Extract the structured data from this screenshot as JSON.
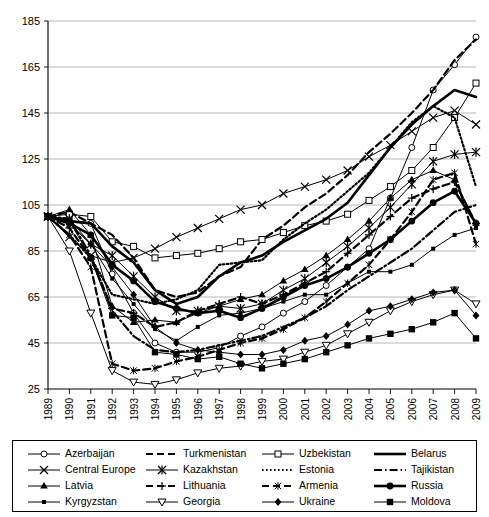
{
  "chart_data": {
    "type": "line",
    "title": "",
    "xlabel": "",
    "ylabel": "",
    "xlim": [
      1989,
      2009
    ],
    "ylim": [
      25,
      185
    ],
    "yticks": [
      25,
      45,
      65,
      85,
      105,
      125,
      145,
      165,
      185
    ],
    "grid": true,
    "legend_position": "bottom",
    "x": [
      1989,
      1990,
      1991,
      1992,
      1993,
      1994,
      1995,
      1996,
      1997,
      1998,
      1999,
      2000,
      2001,
      2002,
      2003,
      2004,
      2005,
      2006,
      2007,
      2008,
      2009
    ],
    "series": [
      {
        "name": "Azerbaijan",
        "marker": "circle-open",
        "style": "solid",
        "values": [
          100,
          98,
          97,
          75,
          58,
          45,
          41,
          41,
          43,
          48,
          52,
          58,
          63,
          70,
          78,
          86,
          108,
          130,
          155,
          166,
          178
        ]
      },
      {
        "name": "Turkmenistan",
        "marker": "none",
        "style": "dashed",
        "values": [
          100,
          102,
          97,
          92,
          82,
          68,
          65,
          67,
          74,
          78,
          90,
          96,
          104,
          110,
          118,
          128,
          136,
          145,
          155,
          168,
          177
        ]
      },
      {
        "name": "Uzbekistan",
        "marker": "square-open",
        "style": "solid",
        "values": [
          100,
          101,
          100,
          89,
          87,
          82,
          83,
          84,
          86,
          89,
          90,
          93,
          96,
          98,
          101,
          107,
          113,
          120,
          130,
          143,
          158
        ]
      },
      {
        "name": "Belarus",
        "marker": "none",
        "style": "solid-thick",
        "values": [
          100,
          98,
          97,
          87,
          80,
          68,
          62,
          65,
          74,
          80,
          83,
          89,
          94,
          99,
          106,
          118,
          130,
          140,
          148,
          155,
          152
        ]
      },
      {
        "name": "Central Europe",
        "marker": "x",
        "style": "solid",
        "values": [
          100,
          91,
          83,
          80,
          82,
          86,
          91,
          95,
          99,
          103,
          105,
          110,
          113,
          116,
          120,
          126,
          131,
          137,
          143,
          146,
          140
        ]
      },
      {
        "name": "Kazakhstan",
        "marker": "asterisk",
        "style": "solid",
        "values": [
          100,
          99,
          88,
          83,
          74,
          65,
          59,
          59,
          61,
          60,
          62,
          68,
          73,
          80,
          87,
          95,
          104,
          114,
          124,
          127,
          128
        ]
      },
      {
        "name": "Estonia",
        "marker": "none",
        "style": "dotted",
        "values": [
          100,
          92,
          82,
          66,
          64,
          62,
          64,
          68,
          79,
          80,
          81,
          90,
          97,
          103,
          111,
          119,
          130,
          141,
          148,
          143,
          113
        ]
      },
      {
        "name": "Tajikistan",
        "marker": "none",
        "style": "dash-dot",
        "values": [
          100,
          99,
          83,
          59,
          48,
          42,
          41,
          42,
          44,
          46,
          48,
          52,
          56,
          61,
          68,
          74,
          80,
          86,
          94,
          102,
          105
        ]
      },
      {
        "name": "Latvia",
        "marker": "triangle-up",
        "style": "solid",
        "values": [
          100,
          103,
          92,
          61,
          54,
          55,
          54,
          58,
          61,
          64,
          66,
          72,
          77,
          83,
          90,
          98,
          108,
          116,
          120,
          116,
          97
        ]
      },
      {
        "name": "Lithuania",
        "marker": "plus",
        "style": "dashed",
        "values": [
          100,
          95,
          82,
          60,
          58,
          52,
          54,
          59,
          62,
          65,
          62,
          66,
          71,
          76,
          84,
          92,
          100,
          108,
          112,
          115,
          97
        ]
      },
      {
        "name": "Armenia",
        "marker": "asterisk-small",
        "style": "dashed",
        "values": [
          100,
          92,
          78,
          36,
          33,
          34,
          37,
          39,
          42,
          45,
          47,
          51,
          56,
          63,
          71,
          79,
          90,
          102,
          116,
          119,
          88
        ]
      },
      {
        "name": "Russia",
        "marker": "hexagon-filled",
        "style": "solid-thick",
        "values": [
          100,
          97,
          92,
          79,
          72,
          63,
          60,
          58,
          59,
          56,
          60,
          65,
          70,
          73,
          78,
          84,
          90,
          98,
          106,
          111,
          97
        ]
      },
      {
        "name": "Kyrgyzstan",
        "marker": "square-small",
        "style": "solid",
        "values": [
          100,
          97,
          88,
          73,
          62,
          51,
          46,
          52,
          57,
          58,
          60,
          63,
          66,
          66,
          71,
          76,
          76,
          79,
          86,
          92,
          95
        ]
      },
      {
        "name": "Georgia",
        "marker": "triangle-down",
        "style": "solid",
        "values": [
          100,
          85,
          58,
          33,
          28,
          27,
          29,
          32,
          34,
          35,
          37,
          38,
          41,
          44,
          49,
          54,
          59,
          63,
          66,
          68,
          62
        ]
      },
      {
        "name": "Ukraine",
        "marker": "diamond-filled",
        "style": "solid",
        "values": [
          100,
          97,
          88,
          78,
          66,
          52,
          45,
          42,
          41,
          40,
          40,
          42,
          46,
          48,
          53,
          59,
          61,
          64,
          67,
          68,
          57
        ]
      },
      {
        "name": "Moldova",
        "marker": "square-filled",
        "style": "solid",
        "values": [
          100,
          98,
          82,
          57,
          56,
          41,
          40,
          38,
          39,
          36,
          34,
          36,
          38,
          41,
          44,
          47,
          49,
          51,
          54,
          58,
          47
        ]
      }
    ]
  },
  "legend": {
    "entries": [
      {
        "label": "Azerbaijan"
      },
      {
        "label": "Turkmenistan"
      },
      {
        "label": "Uzbekistan"
      },
      {
        "label": "Belarus"
      },
      {
        "label": "Central Europe"
      },
      {
        "label": "Kazakhstan"
      },
      {
        "label": "Estonia"
      },
      {
        "label": "Tajikistan"
      },
      {
        "label": "Latvia"
      },
      {
        "label": "Lithuania"
      },
      {
        "label": "Armenia"
      },
      {
        "label": "Russia"
      },
      {
        "label": "Kyrgyzstan"
      },
      {
        "label": "Georgia"
      },
      {
        "label": "Ukraine"
      },
      {
        "label": "Moldova"
      }
    ]
  },
  "colors": {
    "ink": "#000000",
    "grid": "#9a9a9a",
    "background": "#ffffff"
  }
}
